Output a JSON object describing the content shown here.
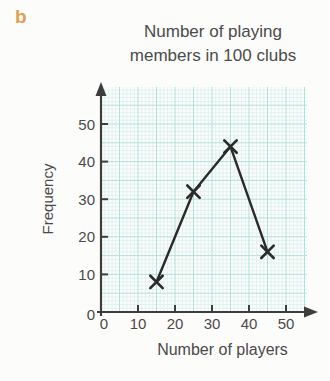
{
  "part_label": "b",
  "chart_data": {
    "type": "line",
    "subtype": "frequency-polygon",
    "title": "Number of playing members in 100 clubs",
    "xlabel": "Number of players",
    "ylabel": "Frequency",
    "x": [
      15,
      25,
      35,
      45
    ],
    "values": [
      8,
      32,
      44,
      16
    ],
    "series": [
      {
        "name": "Frequency of clubs",
        "x": [
          15,
          25,
          35,
          45
        ],
        "values": [
          8,
          32,
          44,
          16
        ]
      }
    ],
    "x_ticks": [
      0,
      10,
      20,
      30,
      40,
      50
    ],
    "y_ticks": [
      0,
      10,
      20,
      30,
      40,
      50
    ],
    "xlim": [
      0,
      56
    ],
    "ylim": [
      0,
      60
    ],
    "grid": "graph-paper, minor every 1 unit, major every 5 units",
    "legend": "none",
    "marker": "x",
    "colors": {
      "line": "#2a2a2a",
      "marker": "#2a2a2a",
      "axis": "#3d3d3d",
      "tick_text": "#4a4a4a",
      "grid_minor": "#e0f2ef",
      "grid_major": "#b2e0dc",
      "title_text": "#4b4b4b",
      "part_label": "#dfa14f"
    }
  }
}
